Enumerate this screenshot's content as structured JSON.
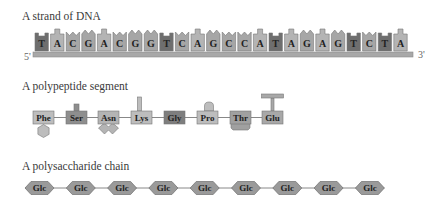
{
  "dna": {
    "title": "A strand of DNA",
    "five_prime_label": "5'",
    "three_prime_label": "3'",
    "sequence": [
      "T",
      "A",
      "C",
      "G",
      "A",
      "C",
      "G",
      "G",
      "T",
      "C",
      "A",
      "G",
      "C",
      "C",
      "A",
      "T",
      "A",
      "G",
      "A",
      "G",
      "T",
      "C",
      "T",
      "A"
    ],
    "colors": {
      "T": "#6e6e6e",
      "A": "#b4b4b4",
      "C": "#a6a6a6",
      "G": "#a6a6a6",
      "backbone": "#a8a8a8"
    }
  },
  "polypeptide": {
    "title": "A polypeptide segment",
    "residues": [
      {
        "label": "Phe",
        "side_chain": "hexagon-below",
        "color": "#bdbdbd"
      },
      {
        "label": "Ser",
        "side_chain": "short-stub-above",
        "color": "#8e8e8e"
      },
      {
        "label": "Asn",
        "side_chain": "v-below",
        "color": "#b4b4b4"
      },
      {
        "label": "Lys",
        "side_chain": "tall-stub-above",
        "color": "#bdbdbd"
      },
      {
        "label": "Gly",
        "side_chain": "none",
        "color": "#7e7e7e"
      },
      {
        "label": "Pro",
        "side_chain": "rounded-above",
        "color": "#bdbdbd"
      },
      {
        "label": "Thr",
        "side_chain": "block-below",
        "color": "#a0a0a0"
      },
      {
        "label": "Glu",
        "side_chain": "t-above",
        "color": "#a8a8a8"
      }
    ]
  },
  "polysaccharide": {
    "title": "A polysaccharide chain",
    "units": [
      "Glc",
      "Glc",
      "Glc",
      "Glc",
      "Glc",
      "Glc",
      "Glc",
      "Glc",
      "Glc"
    ],
    "color": "#9a9a9a"
  }
}
